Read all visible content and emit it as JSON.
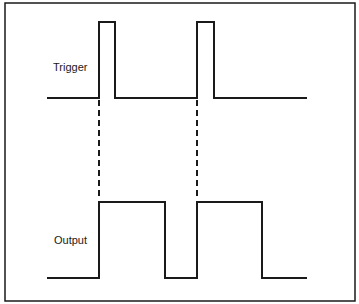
{
  "diagram": {
    "type": "timing-diagram",
    "colors": {
      "stroke": "#1a1a1a",
      "background": "#ffffff"
    },
    "frame": {
      "x": 5,
      "y": 3,
      "width": 350,
      "height": 298
    },
    "signals": [
      {
        "name": "trigger",
        "label": "Trigger",
        "label_pos": {
          "x": 53,
          "y": 71
        },
        "low_y": 98,
        "high_y": 22,
        "start_x": 47,
        "end_x": 307,
        "pulses": [
          {
            "rise_x": 99,
            "fall_x": 115
          },
          {
            "rise_x": 197,
            "fall_x": 214
          }
        ]
      },
      {
        "name": "output",
        "label": "Output",
        "label_pos": {
          "x": 54,
          "y": 244
        },
        "low_y": 278,
        "high_y": 202,
        "start_x": 47,
        "end_x": 307,
        "pulses": [
          {
            "rise_x": 99,
            "fall_x": 165
          },
          {
            "rise_x": 197,
            "fall_x": 262
          }
        ]
      }
    ],
    "dashed_links": [
      {
        "x": 99,
        "y1": 100,
        "y2": 200
      },
      {
        "x": 197,
        "y1": 100,
        "y2": 200
      }
    ]
  }
}
